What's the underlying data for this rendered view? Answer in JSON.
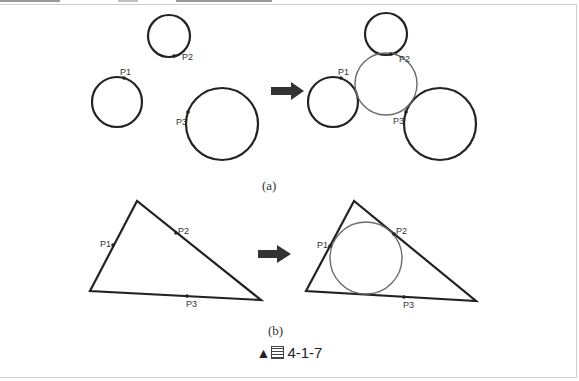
{
  "figure": {
    "title_prefix": "▲",
    "title_glyph": "圖",
    "title_number": "4-1-7"
  },
  "panel_a": {
    "caption": "(a)",
    "before": {
      "points": [
        {
          "label": "P1"
        },
        {
          "label": "P2"
        },
        {
          "label": "P3"
        }
      ]
    },
    "after": {
      "points": [
        {
          "label": "P1"
        },
        {
          "label": "P2"
        },
        {
          "label": "P3"
        }
      ]
    },
    "arrow_icon": "right-arrow-icon"
  },
  "panel_b": {
    "caption": "(b)",
    "before": {
      "points": [
        {
          "label": "P1"
        },
        {
          "label": "P2"
        },
        {
          "label": "P3"
        }
      ]
    },
    "after": {
      "points": [
        {
          "label": "P1"
        },
        {
          "label": "P2"
        },
        {
          "label": "P3"
        }
      ]
    },
    "arrow_icon": "right-arrow-icon"
  },
  "colors": {
    "stroke_dark": "#222222",
    "stroke_tangent_circle": "#6b6b6b",
    "arrow": "#333333"
  }
}
